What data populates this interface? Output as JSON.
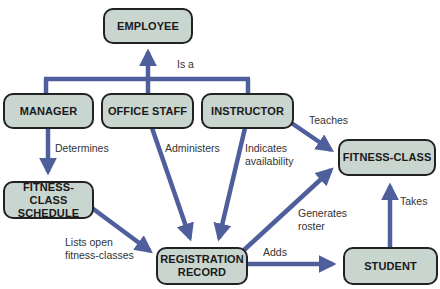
{
  "diagram": {
    "type": "concept-map",
    "colors": {
      "node_fill": "#c9d5cf",
      "node_border": "#222222",
      "arrow": "#4f5f9c",
      "text": "#1a1a1a"
    },
    "nodes": {
      "employee": "EMPLOYEE",
      "manager": "MANAGER",
      "office_staff": "OFFICE STAFF",
      "instructor": "INSTRUCTOR",
      "fitness_class": "FITNESS-CLASS",
      "schedule_line1": "FITNESS-CLASS",
      "schedule_line2": "SCHEDULE",
      "registration_line1": "REGISTRATION",
      "registration_line2": "RECORD",
      "student": "STUDENT"
    },
    "edges": [
      {
        "from": "MANAGER, OFFICE STAFF, INSTRUCTOR",
        "to": "EMPLOYEE",
        "label": "Is a"
      },
      {
        "from": "MANAGER",
        "to": "FITNESS-CLASS SCHEDULE",
        "label": "Determines"
      },
      {
        "from": "OFFICE STAFF",
        "to": "REGISTRATION RECORD",
        "label": "Administers"
      },
      {
        "from": "INSTRUCTOR",
        "to": "REGISTRATION RECORD",
        "label": "Indicates availability"
      },
      {
        "from": "INSTRUCTOR",
        "to": "FITNESS-CLASS",
        "label": "Teaches"
      },
      {
        "from": "FITNESS-CLASS SCHEDULE",
        "to": "REGISTRATION RECORD",
        "label": "Lists open fitness-classes"
      },
      {
        "from": "REGISTRATION RECORD",
        "to": "FITNESS-CLASS",
        "label": "Generates roster"
      },
      {
        "from": "REGISTRATION RECORD",
        "to": "STUDENT",
        "label": "Adds"
      },
      {
        "from": "STUDENT",
        "to": "FITNESS-CLASS",
        "label": "Takes"
      }
    ],
    "labels": {
      "is_a": "Is a",
      "determines": "Determines",
      "administers": "Administers",
      "indicates_line1": "Indicates",
      "indicates_line2": "availability",
      "teaches": "Teaches",
      "lists_line1": "Lists open",
      "lists_line2": "fitness-classes",
      "generates_line1": "Generates",
      "generates_line2": "roster",
      "adds": "Adds",
      "takes": "Takes"
    }
  }
}
